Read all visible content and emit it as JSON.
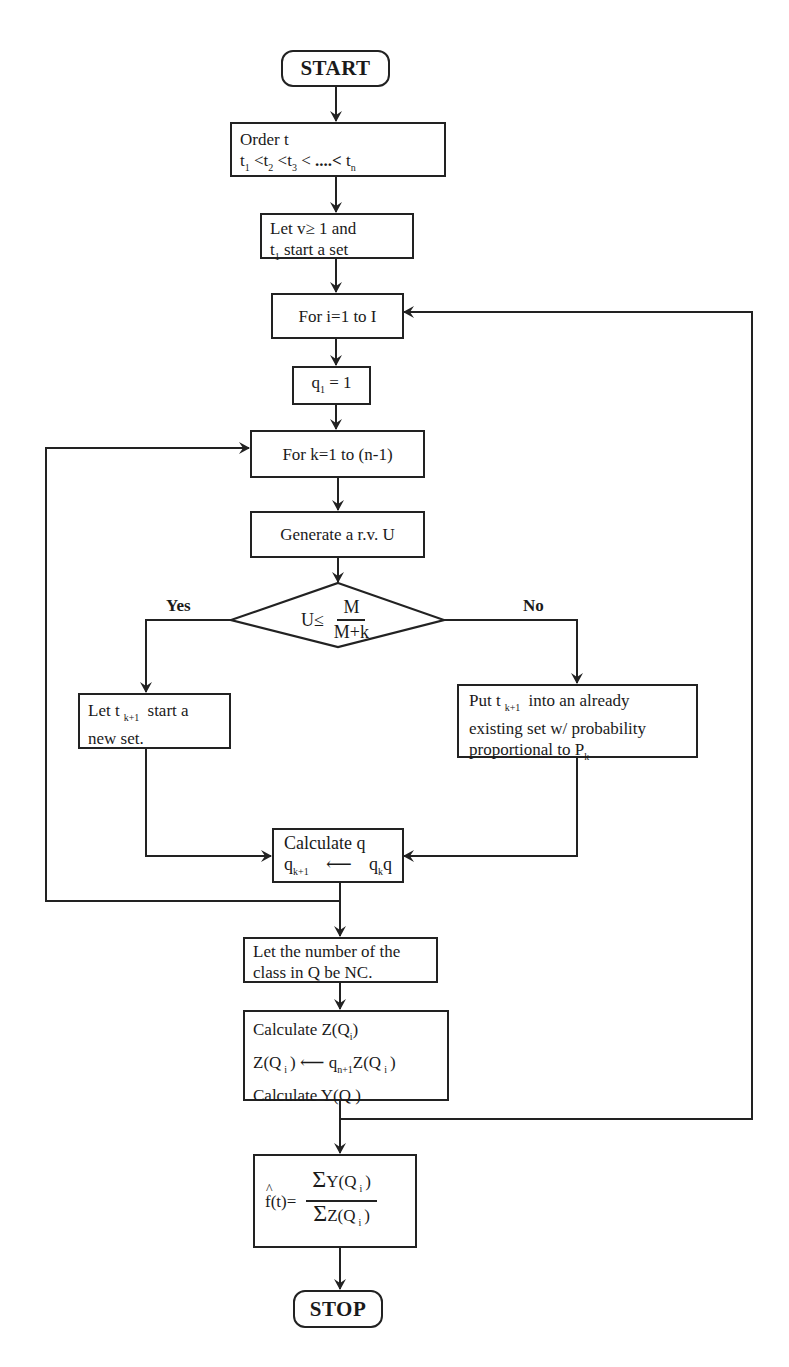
{
  "flowchart": {
    "start": "START",
    "stop": "STOP",
    "order": {
      "line1": "Order  t",
      "seq": [
        {
          "t": "t",
          "sub": "1"
        },
        {
          "op": "<"
        },
        {
          "t": "t",
          "sub": "2"
        },
        {
          "op": "<"
        },
        {
          "t": "t",
          "sub": "3"
        },
        {
          "op": "<"
        },
        {
          "op": " ....<"
        },
        {
          "t": "t",
          "sub": "n"
        }
      ]
    },
    "let_v": {
      "line1": "Let  v≥ 1  and",
      "line2_t": "t",
      "line2_sub": "1",
      "line2_rest": " start a set"
    },
    "for_i": "For  i=1  to  I",
    "q1": {
      "q": "q",
      "sub": "1",
      "rest": " = 1"
    },
    "for_k": "For k=1 to (n-1)",
    "generate": "Generate a r.v. U",
    "decision": {
      "lhs": "U≤",
      "num": "M",
      "den": "M+k"
    },
    "yes_label": "Yes",
    "no_label": "No",
    "yes_box": {
      "pre": "Let  t",
      "sub": "k+1",
      "post": " start a",
      "line2": "new set."
    },
    "no_box": {
      "pre": "Put  t",
      "sub": "k+1",
      "post": " into an already",
      "line2": "existing set w/ probability",
      "line3_pre": "proportional to P",
      "line3_sub": "k"
    },
    "calc_q": {
      "line1": "Calculate  q",
      "lhs": "q",
      "lhs_sub": "k+1",
      "arrow": "⟵",
      "rhs1": "q",
      "rhs1_sub": "k",
      "rhs2": "q"
    },
    "nc_box": {
      "line1": "Let the number of the",
      "line2": "class in Q be NC."
    },
    "calc_z": {
      "line1": "Calculate Z(Q",
      "line1_sub": "i",
      "line1_end": ")",
      "line2_lhs": "Z(Q",
      "line2_lhs_sub": "i",
      "line2_lhs_end": ")",
      "line2_arrow": "⟵",
      "line2_q": "q",
      "line2_q_sub": "n+1",
      "line2_rhs": "Z(Q",
      "line2_rhs_sub": "i",
      "line2_rhs_end": ")",
      "line3": "Calculate Y(Q )"
    },
    "estimator": {
      "lhs": "f(t)=",
      "num_sigma": "Σ",
      "num": "Y(Q",
      "num_sub": "i",
      "num_end": ")",
      "den_sigma": "Σ",
      "den": "Z(Q",
      "den_sub": "i",
      "den_end": ")"
    }
  },
  "colors": {
    "stroke": "#222222",
    "background": "#ffffff",
    "text": "#1a1a1a"
  }
}
